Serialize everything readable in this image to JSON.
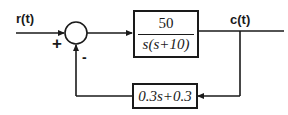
{
  "diagram": {
    "type": "feedback-control-block-diagram",
    "input_signal": "r(t)",
    "output_signal": "c(t)",
    "summing_junction": {
      "plus_sign": "+",
      "minus_sign": "-"
    },
    "forward_block": {
      "numerator": "50",
      "denominator": "s(s+10)"
    },
    "feedback_block": {
      "transfer_function": "0.3s+0.3"
    },
    "colors": {
      "line": "#1a1a1a",
      "background": "#ffffff"
    }
  }
}
